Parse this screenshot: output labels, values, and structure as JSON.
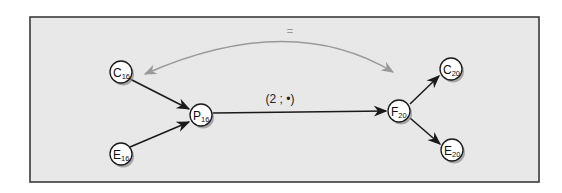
{
  "diagram": {
    "type": "flow-graph",
    "colors": {
      "frame_fill": "#e8e8e8",
      "frame_stroke": "#3a3a3a",
      "edge": "#1a1a1a",
      "relation_arrow": "#9a9a9a",
      "node_fill": "#ffffff",
      "node_stroke": "#1a1a1a",
      "node_shadow": "#8a8a8a"
    },
    "nodes": [
      {
        "id": "C16",
        "letter": "C",
        "subscript": "16"
      },
      {
        "id": "E16",
        "letter": "E",
        "subscript": "16"
      },
      {
        "id": "P16",
        "letter": "P",
        "subscript": "16"
      },
      {
        "id": "F20",
        "letter": "F",
        "subscript": "20"
      },
      {
        "id": "C20",
        "letter": "C",
        "subscript": "20"
      },
      {
        "id": "E20",
        "letter": "E",
        "subscript": "20"
      }
    ],
    "edges": [
      {
        "from": "C16",
        "to": "P16",
        "label": ""
      },
      {
        "from": "E16",
        "to": "P16",
        "label": ""
      },
      {
        "from": "P16",
        "to": "F20",
        "label": "(2 ; •)"
      },
      {
        "from": "F20",
        "to": "C20",
        "label": ""
      },
      {
        "from": "F20",
        "to": "E20",
        "label": ""
      }
    ],
    "relation": {
      "between": [
        "C16",
        "C20"
      ],
      "label": "=",
      "bidirectional": true
    }
  }
}
